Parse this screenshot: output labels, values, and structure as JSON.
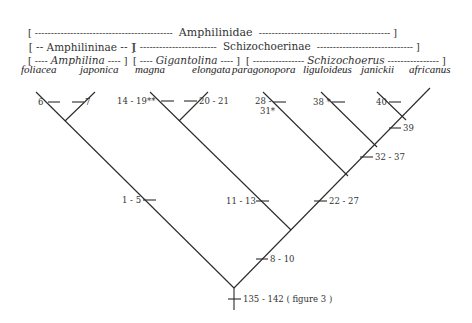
{
  "classification": {
    "family_row": {
      "open": "[ ",
      "dashes_left": "-------------------------------------------",
      "label": "Amphilinidae",
      "dashes_right": "-----------------------------------------",
      "close": " ]"
    },
    "subfamily_row": [
      {
        "label": "[ -- Amphilininae -- ]"
      },
      {
        "open": "[ ",
        "dashes_left": "------------------------",
        "label": "Schizochoerinae",
        "dashes_right": "------------------------------",
        "close": " ]"
      }
    ],
    "genus_row": [
      {
        "open": "[ ---- ",
        "label": "Amphilina",
        "close": " ---- ]"
      },
      {
        "open": "[ ---- ",
        "label": "Gigantolina",
        "close": " ---- ]"
      },
      {
        "open": "[ ---------------- ",
        "label": "Schizochoerus",
        "close": " ---------------- ]"
      }
    ]
  },
  "taxa": [
    "foliacea",
    "japonica",
    "magna",
    "elongata",
    "paragonopora",
    "liguloideus",
    "janickii",
    "africanus"
  ],
  "characters": {
    "foliacea": "6",
    "japonica": "7",
    "magna": "14 - 19**",
    "elongata": "20 - 21",
    "paragonopora_a": "28 -",
    "paragonopora_b": "31*",
    "liguloideus": "38 *",
    "janickii": "40",
    "janickii_africanus": "39",
    "schizochoerus_clade": "32 - 37",
    "amphilina": "1 - 5",
    "gigantolina": "11 - 13",
    "schizochoerinae": "22 - 27",
    "gig_schiz": "8 - 10",
    "root": "135 - 142 ( figure 3 )"
  },
  "colors": {
    "line": "#2a2a2a",
    "text": "#333333",
    "background": "#ffffff"
  }
}
